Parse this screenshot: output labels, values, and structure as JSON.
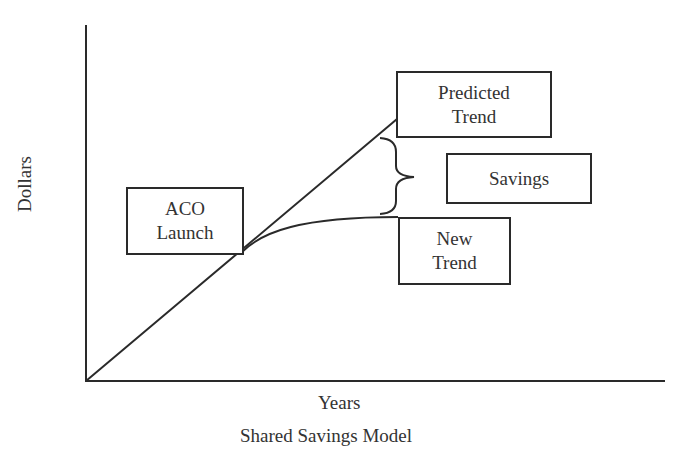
{
  "diagram": {
    "title": "Shared Savings Model",
    "x_axis_label": "Years",
    "y_axis_label": "Dollars",
    "boxes": {
      "aco_launch": [
        "ACO",
        "Launch"
      ],
      "predicted_trend": [
        "Predicted",
        "Trend"
      ],
      "savings": [
        "Savings"
      ],
      "new_trend": [
        "New",
        "Trend"
      ]
    },
    "lines": [
      {
        "name": "Predicted Trend",
        "shape": "straight line rising from origin"
      },
      {
        "name": "New Trend",
        "shape": "diverges after ACO Launch and levels off"
      }
    ],
    "annotation": "Brace marks the gap between Predicted Trend and New Trend labeled Savings",
    "stroke_color": "#2a2a2a"
  }
}
